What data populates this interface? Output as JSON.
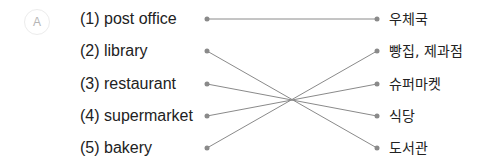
{
  "exercise": {
    "label": "A",
    "colors": {
      "text": "#222222",
      "line": "#8a8a8a",
      "dot": "#8a8a8a",
      "badge_text": "#b5b5b5",
      "badge_border": "#ececec"
    },
    "left_items": [
      {
        "number": "(1)",
        "text": "(1) post office",
        "y": 19
      },
      {
        "number": "(2)",
        "text": "(2) library",
        "y": 51
      },
      {
        "number": "(3)",
        "text": "(3) restaurant",
        "y": 84
      },
      {
        "number": "(4)",
        "text": "(4) supermarket",
        "y": 116
      },
      {
        "number": "(5)",
        "text": "(5) bakery",
        "y": 148
      }
    ],
    "right_items": [
      {
        "text": "우체국",
        "y": 19
      },
      {
        "text": "빵집, 제과점",
        "y": 51
      },
      {
        "text": "슈퍼마켓",
        "y": 84
      },
      {
        "text": "식당",
        "y": 116
      },
      {
        "text": "도서관",
        "y": 148
      }
    ],
    "connections": [
      {
        "from": "(1) post office",
        "to": "우체국"
      },
      {
        "from": "(2) library",
        "to": "도서관"
      },
      {
        "from": "(3) restaurant",
        "to": "식당"
      },
      {
        "from": "(4) supermarket",
        "to": "슈퍼마켓"
      },
      {
        "from": "(5) bakery",
        "to": "빵집, 제과점"
      }
    ]
  }
}
